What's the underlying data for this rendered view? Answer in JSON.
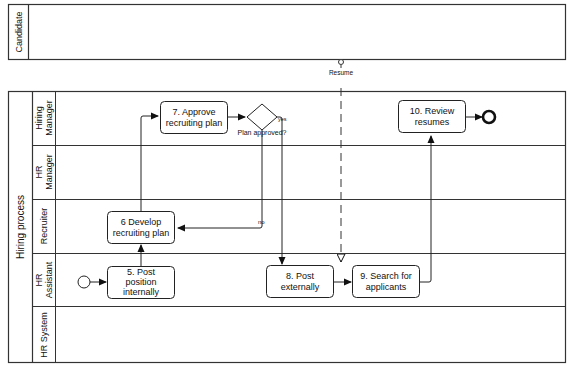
{
  "pools": {
    "candidate": {
      "label": "Candidate"
    },
    "hiring": {
      "label": "Hiring process"
    }
  },
  "lanes": [
    {
      "line1": "Hiring",
      "line2": "Manager"
    },
    {
      "line1": "HR",
      "line2": "Manager"
    },
    {
      "line1": "Recruiter",
      "line2": ""
    },
    {
      "line1": "HR",
      "line2": "Assistant"
    },
    {
      "line1": "HR System",
      "line2": ""
    }
  ],
  "tasks": {
    "t5": {
      "line1": "5. Post",
      "line2": "position",
      "line3": "internally"
    },
    "t6": {
      "line1": "6 Develop",
      "line2": "recruiting plan"
    },
    "t7": {
      "line1": "7. Approve",
      "line2": "recruiting plan"
    },
    "t8": {
      "line1": "8. Post",
      "line2": "externally"
    },
    "t9": {
      "line1": "9. Search for",
      "line2": "applicants"
    },
    "t10": {
      "line1": "10. Review",
      "line2": "resumes"
    }
  },
  "gateway": {
    "label": "Plan approved?",
    "yes": "yes",
    "no": "no"
  },
  "message_flow": {
    "label": "Resume"
  },
  "colors": {
    "stroke": "#222222",
    "background": "#ffffff"
  }
}
